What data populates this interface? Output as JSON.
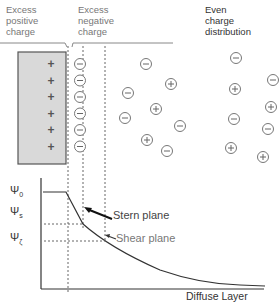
{
  "headers": {
    "positive": [
      "Excess",
      "positive",
      "charge"
    ],
    "negative": [
      "Excess",
      "negative",
      "charge"
    ],
    "even": [
      "Even",
      "charge",
      "distribution"
    ]
  },
  "surface_charges": [
    "+",
    "+",
    "+",
    "+",
    "+",
    "+"
  ],
  "stern_layer_ions": [
    "−",
    "−",
    "−",
    "−",
    "−",
    "−"
  ],
  "diffuse_ions": [
    {
      "sign": "−",
      "x": 146,
      "y": 64
    },
    {
      "sign": "+",
      "x": 171,
      "y": 84
    },
    {
      "sign": "−",
      "x": 128,
      "y": 93
    },
    {
      "sign": "+",
      "x": 156,
      "y": 109
    },
    {
      "sign": "−",
      "x": 125,
      "y": 118
    },
    {
      "sign": "−",
      "x": 180,
      "y": 126
    },
    {
      "sign": "+",
      "x": 147,
      "y": 140
    },
    {
      "sign": "−",
      "x": 167,
      "y": 151
    }
  ],
  "even_ions": [
    {
      "sign": "−",
      "x": 236,
      "y": 58
    },
    {
      "sign": "+",
      "x": 235,
      "y": 89
    },
    {
      "sign": "−",
      "x": 273,
      "y": 80
    },
    {
      "sign": "+",
      "x": 271,
      "y": 107
    },
    {
      "sign": "−",
      "x": 234,
      "y": 119
    },
    {
      "sign": "−",
      "x": 268,
      "y": 129
    },
    {
      "sign": "+",
      "x": 231,
      "y": 148
    },
    {
      "sign": "+",
      "x": 263,
      "y": 157
    }
  ],
  "graph": {
    "psi_0": "Ψ0",
    "psi_s": "Ψs",
    "psi_zeta": "Ψζ",
    "psi_0_sub": "0",
    "psi_s_sub": "s",
    "psi_zeta_sub": "ζ",
    "psi_symbol": "Ψ",
    "stern_plane": "Stern plane",
    "shear_plane": "Shear plane",
    "diffuse_layer": "Diffuse Layer"
  }
}
